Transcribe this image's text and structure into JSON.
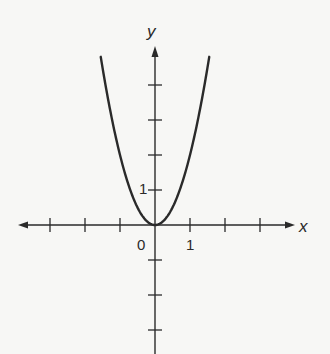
{
  "chart_data": {
    "type": "line",
    "title": "",
    "function": "y = 2x^2",
    "xlabel": "x",
    "ylabel": "y",
    "xlim": [
      -3.9,
      4.1
    ],
    "ylim": [
      -3.7,
      5.0
    ],
    "x_ticks": [
      -3,
      -2,
      -1,
      0,
      1,
      2,
      3
    ],
    "y_ticks": [
      -3,
      -2,
      -1,
      1,
      2,
      3,
      4
    ],
    "tick_labels": {
      "origin": "0",
      "x_one": "1",
      "y_one": "1"
    },
    "grid": false,
    "legend": null,
    "series": [
      {
        "name": "parabola",
        "x": [
          -1.55,
          -1.25,
          -1.0,
          -0.75,
          -0.5,
          -0.25,
          0,
          0.25,
          0.5,
          0.75,
          1.0,
          1.25,
          1.55
        ],
        "y": [
          4.8,
          3.125,
          2.0,
          1.125,
          0.5,
          0.125,
          0,
          0.125,
          0.5,
          1.125,
          2.0,
          3.125,
          4.8
        ]
      }
    ]
  },
  "labels": {
    "x_axis": "x",
    "y_axis": "y",
    "origin": "0",
    "x_one": "1",
    "y_one": "1"
  },
  "colors": {
    "ink": "#2a2a2a",
    "background": "#f7f7f5"
  }
}
